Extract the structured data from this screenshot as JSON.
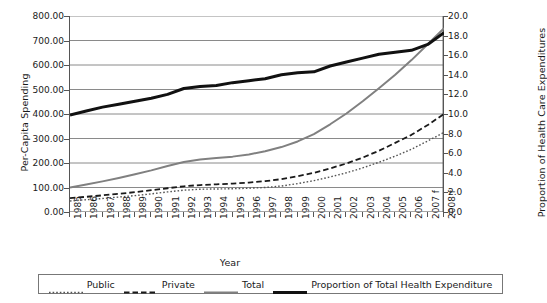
{
  "chart_data": {
    "type": "line",
    "title": "",
    "xlabel": "Year",
    "ylabel": "Per-Capita Spending",
    "ylabel_secondary": "Proportion of Health Care Expenditures",
    "grid": true,
    "legend_position": "bottom",
    "ylim": [
      0,
      800
    ],
    "ylim_secondary": [
      0,
      20
    ],
    "y_ticks": [
      "0.00",
      "100.00",
      "200.00",
      "300.00",
      "400.00",
      "500.00",
      "600.00",
      "700.00",
      "800.00"
    ],
    "y_ticks_secondary": [
      "0.0",
      "2.0",
      "4.0",
      "6.0",
      "8.0",
      "10.0",
      "12.0",
      "14.0",
      "16.0",
      "18.0",
      "20.0"
    ],
    "categories": [
      "1985",
      "1986",
      "1987",
      "1988",
      "1989",
      "1990",
      "1991",
      "1992",
      "1993",
      "1994",
      "1995",
      "1996",
      "1997",
      "1998",
      "1999",
      "2000",
      "2001",
      "2002",
      "2003",
      "2004",
      "2005",
      "2006",
      "2007 f",
      "2008 f"
    ],
    "series": [
      {
        "name": "Public",
        "axis": "left",
        "style": "dotted",
        "color": "#555555",
        "values": [
          45,
          50,
          55,
          61,
          67,
          74,
          82,
          89,
          93,
          94,
          95,
          97,
          100,
          106,
          116,
          128,
          143,
          160,
          180,
          203,
          228,
          256,
          290,
          325
        ]
      },
      {
        "name": "Private",
        "axis": "left",
        "style": "dashed",
        "color": "#1a1a1a",
        "values": [
          57,
          62,
          68,
          74,
          81,
          89,
          97,
          105,
          110,
          113,
          116,
          120,
          126,
          134,
          146,
          160,
          178,
          198,
          222,
          250,
          282,
          315,
          355,
          400
        ]
      },
      {
        "name": "Total",
        "axis": "left",
        "style": "solid",
        "color": "#808080",
        "values": [
          100,
          112,
          125,
          139,
          154,
          170,
          188,
          204,
          214,
          220,
          226,
          235,
          248,
          265,
          288,
          318,
          358,
          402,
          452,
          505,
          560,
          620,
          685,
          750
        ]
      },
      {
        "name": "Proportion of Total Health Expenditure",
        "axis": "right",
        "style": "bold-solid",
        "color": "#111111",
        "values": [
          9.9,
          10.3,
          10.7,
          11.0,
          11.3,
          11.6,
          12.0,
          12.6,
          12.8,
          12.9,
          13.2,
          13.4,
          13.6,
          14.0,
          14.2,
          14.3,
          14.9,
          15.3,
          15.7,
          16.1,
          16.3,
          16.5,
          17.1,
          18.3
        ]
      }
    ]
  },
  "legend": {
    "items": [
      {
        "label": "Public",
        "style": "dotted",
        "color": "#555555"
      },
      {
        "label": "Private",
        "style": "dashed",
        "color": "#1a1a1a"
      },
      {
        "label": "Total",
        "style": "solid",
        "color": "#808080"
      },
      {
        "label": "Proportion of Total Health Expenditure",
        "style": "bold-solid",
        "color": "#111111"
      }
    ]
  }
}
